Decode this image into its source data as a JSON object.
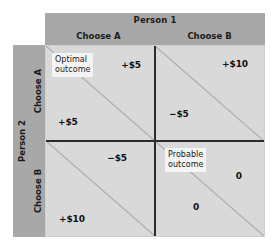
{
  "figure": {
    "type": "payoff-matrix"
  },
  "columns": {
    "header": "Person 1",
    "options": [
      "Choose A",
      "Choose B"
    ]
  },
  "rows": {
    "header": "Person 2",
    "options": [
      "Choose A",
      "Choose B"
    ]
  },
  "cells": {
    "top_left": {
      "name": "A-A",
      "callout": "Optimal\noutcome",
      "person1_payoff": "+$5",
      "person2_payoff": "+$5"
    },
    "top_right": {
      "name": "B-A",
      "callout": "",
      "person1_payoff": "+$10",
      "person2_payoff": "−$5"
    },
    "bottom_left": {
      "name": "A-B",
      "callout": "",
      "person1_payoff": "−$5",
      "person2_payoff": "+$10"
    },
    "bottom_right": {
      "name": "B-B",
      "callout": "Probable\noutcome",
      "person1_payoff": "0",
      "person2_payoff": "0"
    }
  },
  "colors": {
    "band": "#a8a8a8",
    "cell": "#d9d9d9",
    "divider": "#2b2b2b",
    "diagonal": "#adadad",
    "callout_bg": "#f4f4f2",
    "text": "#1a1a1a",
    "page_bg": "#ffffff"
  }
}
